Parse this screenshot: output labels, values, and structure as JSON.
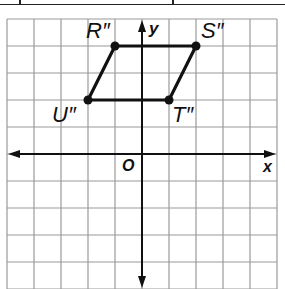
{
  "diagram": {
    "type": "coordinate-plane",
    "grid": {
      "columns": 10,
      "rows": 10,
      "x_range": [
        -5,
        5
      ],
      "y_range": [
        -5,
        5
      ]
    },
    "axes": {
      "x_label": "x",
      "y_label": "y",
      "origin_label": "O"
    },
    "shape": "parallelogram",
    "points": [
      {
        "name": "R''",
        "label": "R″",
        "x": -1,
        "y": 4
      },
      {
        "name": "S''",
        "label": "S″",
        "x": 2,
        "y": 4
      },
      {
        "name": "T''",
        "label": "T″",
        "x": 1,
        "y": 2
      },
      {
        "name": "U''",
        "label": "U″",
        "x": -2,
        "y": 2
      }
    ],
    "colors": {
      "grid": "#9a9a9a",
      "axis": "#111111",
      "shape": "#111111"
    }
  }
}
